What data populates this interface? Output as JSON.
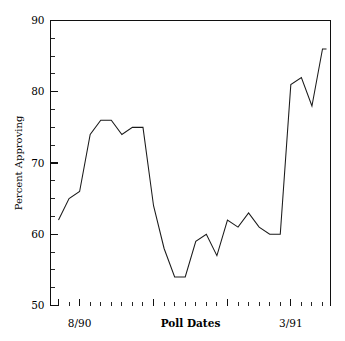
{
  "chart_data": {
    "type": "line",
    "title": "",
    "xlabel": "Poll Dates",
    "ylabel": "Percent Approving",
    "ylim": [
      50,
      90
    ],
    "ytick_labels": [
      "50",
      "60",
      "70",
      "80",
      "90"
    ],
    "ytick_values": [
      50,
      60,
      70,
      80,
      90
    ],
    "y_minor_step": 2.5,
    "xtick_labels": [
      "8/90",
      "3/91"
    ],
    "xtick_label_positions": [
      2,
      22
    ],
    "x_major_tick_indices": [
      0,
      2,
      9,
      16,
      22
    ],
    "x_total_ticks": 26,
    "grid": false,
    "legend": null,
    "x": [
      0,
      1,
      2,
      3,
      4,
      5,
      6,
      7,
      8,
      9,
      10,
      11,
      12,
      13,
      14,
      15,
      16,
      17,
      18,
      19,
      20,
      21,
      22,
      23,
      24,
      25
    ],
    "values": [
      62,
      65,
      66,
      74,
      76,
      76,
      74,
      75,
      75,
      64,
      58,
      54,
      54,
      59,
      60,
      57,
      62,
      61,
      63,
      61,
      60,
      60,
      81,
      82,
      78,
      86
    ],
    "series": [
      {
        "name": "Percent Approving",
        "values": [
          62,
          65,
          66,
          74,
          76,
          76,
          74,
          75,
          75,
          64,
          58,
          54,
          54,
          59,
          60,
          57,
          62,
          61,
          63,
          61,
          60,
          60,
          81,
          82,
          78,
          86
        ]
      }
    ],
    "final_flat_extension": 86,
    "annotations": []
  },
  "axes": {
    "y_label": "Percent Approving",
    "x_label": "Poll Dates",
    "x_left_label": "8/90",
    "x_right_label": "3/91",
    "y_labels": [
      "90",
      "80",
      "70",
      "60",
      "50"
    ]
  },
  "colors": {
    "line": "#1a1a1a",
    "axis": "#101010",
    "background": "#ffffff",
    "text": "#000000"
  }
}
